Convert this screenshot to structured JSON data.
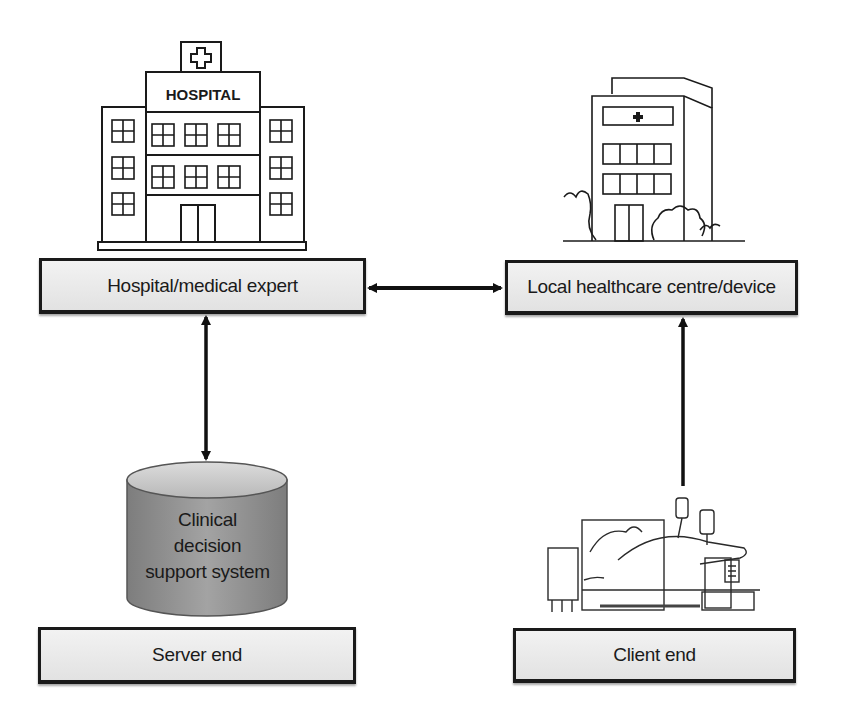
{
  "diagram": {
    "nodes": {
      "hospital": {
        "label": "Hospital/medical expert",
        "sign": "HOSPITAL"
      },
      "local_centre": {
        "label": "Local healthcare centre/device"
      },
      "cdss": {
        "label_lines": [
          "Clinical",
          "decision",
          "support system"
        ]
      },
      "server_end": {
        "label": "Server end"
      },
      "client_end": {
        "label": "Client end"
      }
    },
    "edges": [
      {
        "from": "hospital",
        "to": "local_centre",
        "direction": "bidirectional"
      },
      {
        "from": "hospital",
        "to": "cdss",
        "direction": "bidirectional"
      },
      {
        "from": "client_end",
        "to": "local_centre",
        "direction": "unidirectional"
      }
    ],
    "colors": {
      "box_fill": "#e8e8e8",
      "box_border": "#1a1a1a",
      "cylinder_fill": "#8f8f8f",
      "arrow": "#111111"
    }
  }
}
